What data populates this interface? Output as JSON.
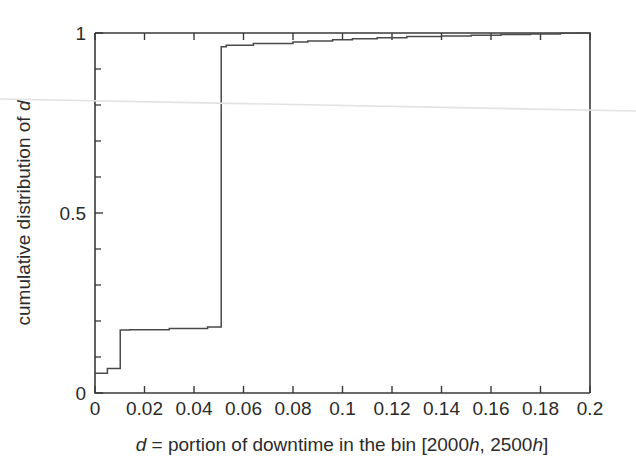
{
  "chart_data": {
    "type": "line",
    "title": "",
    "subtitle": "",
    "xlabel": "d = portion of downtime in the bin [2000h, 2500h]",
    "ylabel": "cumulative distribution of d",
    "xlabel_parts": {
      "var": "d",
      "rest": " = portion of downtime in the bin [2000",
      "unit1": "h",
      "mid": ", 2500",
      "unit2": "h",
      "close": "]"
    },
    "ylabel_parts": {
      "text": "cumulative distribution of ",
      "var": "d"
    },
    "xlim": [
      0,
      0.2
    ],
    "ylim": [
      0,
      1
    ],
    "grid": false,
    "legend": null,
    "x_ticks": [
      0,
      0.02,
      0.04,
      0.06,
      0.08,
      0.1,
      0.12,
      0.14,
      0.16,
      0.18,
      0.2
    ],
    "x_tick_labels": [
      "0",
      "0.02",
      "0.04",
      "0.06",
      "0.08",
      "0.1",
      "0.12",
      "0.14",
      "0.16",
      "0.18",
      "0.2"
    ],
    "y_ticks": [
      0,
      0.5,
      1
    ],
    "y_tick_labels": [
      "0",
      "0.5",
      "1"
    ],
    "y_minor_ticks": [
      0.1,
      0.2,
      0.3,
      0.4,
      0.6,
      0.7,
      0.8,
      0.9
    ],
    "series": [
      {
        "name": "empirical CDF of d",
        "step": "post",
        "x": [
          0.0,
          0.0045,
          0.005,
          0.0098,
          0.0102,
          0.014,
          0.03,
          0.042,
          0.0455,
          0.0505,
          0.051,
          0.053,
          0.06,
          0.064,
          0.072,
          0.08,
          0.086,
          0.096,
          0.104,
          0.114,
          0.126,
          0.14,
          0.152,
          0.164,
          0.176,
          0.188,
          0.195,
          0.2
        ],
        "y": [
          0.055,
          0.055,
          0.068,
          0.068,
          0.175,
          0.176,
          0.179,
          0.179,
          0.183,
          0.183,
          0.962,
          0.966,
          0.966,
          0.971,
          0.971,
          0.975,
          0.978,
          0.981,
          0.984,
          0.987,
          0.99,
          0.992,
          0.994,
          0.996,
          0.997,
          0.999,
          1.0,
          1.0
        ]
      }
    ],
    "key_features": {
      "initial_value": 0.055,
      "plateau_value": 0.183,
      "major_jump_at_x": 0.051,
      "value_after_jump": 0.962,
      "reaches_one_at_x": 0.195
    },
    "colors": {
      "curve": "#4a4a4a",
      "axis": "#3a3a3a",
      "background": "#ffffff",
      "text": "#2b2b2b"
    }
  }
}
